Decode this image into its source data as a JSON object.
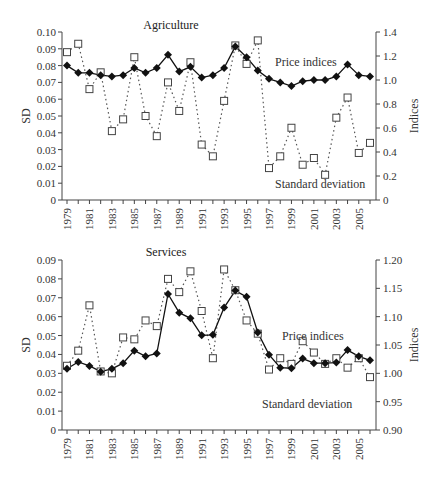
{
  "chart_data": [
    {
      "type": "line",
      "title": "Agriculture",
      "xlabel": "",
      "ylabel": "SD",
      "y2label": "Indices",
      "ylim": [
        0,
        0.1
      ],
      "y2lim": [
        0,
        1.4
      ],
      "yticks": [
        "0",
        "0.01",
        "0.02",
        "0.03",
        "0.04",
        "0.05",
        "0.06",
        "0.07",
        "0.08",
        "0.09",
        "0.10"
      ],
      "y2ticks": [
        "0",
        "0.2",
        "0.4",
        "0.6",
        "0.8",
        "1.0",
        "1.2",
        "1.4"
      ],
      "xticks": [
        "1979",
        "1981",
        "1983",
        "1985",
        "1987",
        "1989",
        "1991",
        "1993",
        "1995",
        "1997",
        "1999",
        "2001",
        "2003",
        "2005"
      ],
      "x": [
        1979,
        1980,
        1981,
        1982,
        1983,
        1984,
        1985,
        1986,
        1987,
        1988,
        1989,
        1990,
        1991,
        1992,
        1993,
        1994,
        1995,
        1996,
        1997,
        1998,
        1999,
        2000,
        2001,
        2002,
        2003,
        2004,
        2005,
        2006
      ],
      "annotations": [
        "Price indices",
        "Standard deviation"
      ],
      "series": [
        {
          "name": "Price indices",
          "axis": "right",
          "marker": "filled-diamond",
          "line": "solid",
          "values": [
            1.12,
            1.06,
            1.06,
            1.04,
            1.03,
            1.04,
            1.1,
            1.06,
            1.1,
            1.21,
            1.07,
            1.11,
            1.02,
            1.04,
            1.1,
            1.28,
            1.19,
            1.08,
            1.01,
            0.98,
            0.95,
            0.99,
            1.0,
            1.0,
            1.03,
            1.13,
            1.04,
            1.03
          ]
        },
        {
          "name": "Standard deviation",
          "axis": "left",
          "marker": "open-square",
          "line": "dotted",
          "values": [
            0.088,
            0.093,
            0.066,
            0.076,
            0.041,
            0.048,
            0.085,
            0.05,
            0.038,
            0.07,
            0.053,
            0.082,
            0.033,
            0.026,
            0.059,
            0.092,
            0.081,
            0.095,
            0.019,
            0.026,
            0.043,
            0.021,
            0.025,
            0.015,
            0.049,
            0.061,
            0.028,
            0.034
          ]
        }
      ]
    },
    {
      "type": "line",
      "title": "Services",
      "xlabel": "",
      "ylabel": "SD",
      "y2label": "Indices",
      "ylim": [
        0,
        0.09
      ],
      "y2lim": [
        0.9,
        1.2
      ],
      "yticks": [
        "0",
        "0.01",
        "0.02",
        "0.03",
        "0.04",
        "0.05",
        "0.06",
        "0.07",
        "0.08",
        "0.09"
      ],
      "y2ticks": [
        "0.90",
        "0.95",
        "1.00",
        "1.05",
        "1.10",
        "1.15",
        "1.20"
      ],
      "xticks": [
        "1979",
        "1981",
        "1983",
        "1985",
        "1987",
        "1989",
        "1991",
        "1993",
        "1995",
        "1997",
        "1999",
        "2001",
        "2003",
        "2005"
      ],
      "x": [
        1979,
        1980,
        1981,
        1982,
        1983,
        1984,
        1985,
        1986,
        1987,
        1988,
        1989,
        1990,
        1991,
        1992,
        1993,
        1994,
        1995,
        1996,
        1997,
        1998,
        1999,
        2000,
        2001,
        2002,
        2003,
        2004,
        2005,
        2006
      ],
      "annotations": [
        "Price indices",
        "Standard deviation"
      ],
      "series": [
        {
          "name": "Price indices",
          "axis": "right",
          "marker": "filled-diamond",
          "line": "solid",
          "values": [
            1.008,
            1.02,
            1.013,
            1.003,
            1.008,
            1.018,
            1.04,
            1.03,
            1.035,
            1.14,
            1.107,
            1.097,
            1.067,
            1.068,
            1.116,
            1.146,
            1.135,
            1.072,
            1.033,
            1.01,
            1.009,
            1.026,
            1.018,
            1.018,
            1.019,
            1.041,
            1.03,
            1.023
          ]
        },
        {
          "name": "Standard deviation",
          "axis": "left",
          "marker": "open-square",
          "line": "dotted",
          "values": [
            0.034,
            0.042,
            0.066,
            0.031,
            0.03,
            0.049,
            0.048,
            0.058,
            0.055,
            0.08,
            0.073,
            0.084,
            0.063,
            0.038,
            0.085,
            0.074,
            0.058,
            0.051,
            0.032,
            0.038,
            0.035,
            0.047,
            0.041,
            0.035,
            0.038,
            0.033,
            0.038,
            0.028
          ]
        }
      ]
    }
  ]
}
